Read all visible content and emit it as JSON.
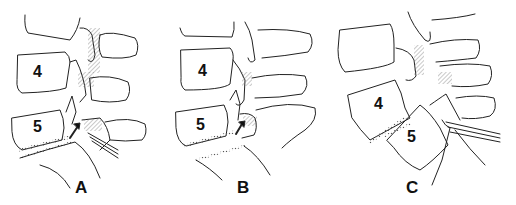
{
  "figure": {
    "line_color": "#222222",
    "background": "#ffffff",
    "panels": [
      {
        "id": "A",
        "label": "A",
        "vertebra_labels": [
          "4",
          "5"
        ],
        "arrow": true
      },
      {
        "id": "B",
        "label": "B",
        "vertebra_labels": [
          "4",
          "5"
        ],
        "arrow": true
      },
      {
        "id": "C",
        "label": "C",
        "vertebra_labels": [
          "4",
          "5"
        ],
        "arrow": false
      }
    ]
  }
}
